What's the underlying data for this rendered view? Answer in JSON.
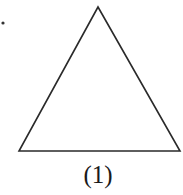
{
  "figure": {
    "caption": "(1)",
    "shape": "triangle",
    "vertices": [
      [
        98,
        7
      ],
      [
        19,
        151
      ],
      [
        180,
        151
      ]
    ],
    "stroke_color": "#2a2a2a",
    "marker_dot": [
      3,
      23
    ]
  }
}
